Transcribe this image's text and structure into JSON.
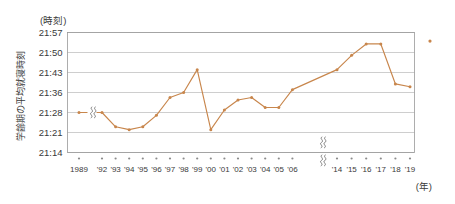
{
  "chart_data": {
    "type": "line",
    "title": "",
    "ylabel": "学齢期の平均就寝時刻",
    "xlabel": "(年)",
    "yunit": "(時刻)",
    "grid": true,
    "legend": "none",
    "ylim": [
      "21:14",
      "21:57"
    ],
    "ytick_labels": [
      "21:57",
      "21:50",
      "21:43",
      "21:36",
      "21:28",
      "21:21",
      "21:14"
    ],
    "ytick_minutes": [
      1317,
      1310,
      1303,
      1296,
      1288,
      1281,
      1274
    ],
    "axis_breaks": {
      "x_break_between": [
        "1989",
        "'92"
      ],
      "x_break_between_2": [
        "'06",
        "'14"
      ],
      "note": "broken x axis: gap after 1989 and gap between '06 and '14"
    },
    "categories": [
      "1989",
      "'92",
      "'93",
      "'94",
      "'95",
      "'96",
      "'97",
      "'98",
      "'99",
      "'00",
      "'01",
      "'02",
      "'03",
      "'04",
      "'05",
      "'06",
      "'14",
      "'15",
      "'16",
      "'17",
      "'18",
      "'19"
    ],
    "values": [
      "21:28",
      "21:28",
      "21:23",
      "21:22",
      "21:23",
      "21:27",
      "21:34",
      "21:36",
      "21:44",
      "21:22",
      "21:29",
      "21:33",
      "21:34",
      "21:30",
      "21:30",
      "21:37",
      "21:44",
      "21:49",
      "21:53",
      "21:53",
      "21:39",
      "21:38"
    ],
    "values_minutes": [
      1288,
      1288,
      1283,
      1282,
      1283,
      1287,
      1294,
      1296,
      1304,
      1282,
      1289,
      1293,
      1294,
      1290,
      1290,
      1297,
      1304,
      1309,
      1313,
      1313,
      1299,
      1298
    ],
    "outlier_marker": {
      "label": "",
      "value": "21:54",
      "value_minutes": 1314,
      "position": "top-right outside plot"
    },
    "colors": {
      "series": "#c8864c",
      "grid": "#b9b9b9",
      "frame": "#9a9a9a",
      "text": "#3a3a3a",
      "background": "#ffffff"
    }
  }
}
